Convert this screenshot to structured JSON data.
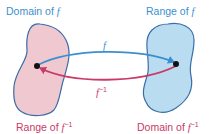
{
  "diagram": {
    "labels": {
      "domain_f": {
        "prefix": "Domain of ",
        "var": "f",
        "sup": ""
      },
      "range_f": {
        "prefix": "Range of ",
        "var": "f",
        "sup": ""
      },
      "range_finv": {
        "prefix": "Range of ",
        "var": "f",
        "sup": "−1"
      },
      "domain_finv": {
        "prefix": "Domain of ",
        "var": "f",
        "sup": "−1"
      },
      "arrow_f": {
        "var": "f",
        "sup": ""
      },
      "arrow_finv": {
        "var": "f",
        "sup": "−1"
      }
    },
    "colors": {
      "blue": "#3b8fd0",
      "red": "#c93a66",
      "left_blob_fill": "#f0c8d0",
      "right_blob_fill": "#b9dcf0",
      "blob_stroke": "#3a6ea8"
    }
  }
}
